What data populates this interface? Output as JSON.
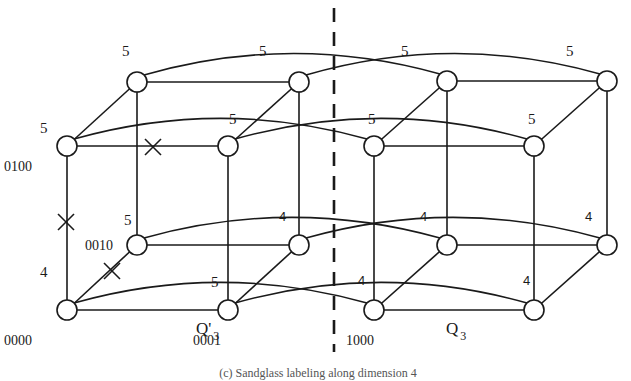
{
  "figure": {
    "caption": "(c) Sandglass labeling along dimension 4",
    "divider": {
      "x": 334,
      "y1": 8,
      "y2": 352
    },
    "cubes": [
      {
        "id": "left",
        "name": "Q'",
        "subscript": "3",
        "label_pos": [
          196,
          334
        ]
      },
      {
        "id": "right",
        "name": "Q",
        "subscript": "3",
        "label_pos": [
          446,
          334
        ]
      }
    ],
    "nodes": [
      {
        "id": "L_TBL",
        "x": 137,
        "y": 82
      },
      {
        "id": "L_TBR",
        "x": 299,
        "y": 82
      },
      {
        "id": "L_TFL",
        "x": 67,
        "y": 146,
        "addr": "0100"
      },
      {
        "id": "L_TFR",
        "x": 228,
        "y": 146
      },
      {
        "id": "L_BBL",
        "x": 137,
        "y": 245,
        "addr": "0010"
      },
      {
        "id": "L_BBR",
        "x": 299,
        "y": 245
      },
      {
        "id": "L_BFL",
        "x": 67,
        "y": 310,
        "addr": "0000"
      },
      {
        "id": "L_BFR",
        "x": 228,
        "y": 310,
        "addr": "0001"
      },
      {
        "id": "R_TBL",
        "x": 447,
        "y": 81
      },
      {
        "id": "R_TBR",
        "x": 607,
        "y": 81
      },
      {
        "id": "R_TFL",
        "x": 374,
        "y": 146
      },
      {
        "id": "R_TFR",
        "x": 534,
        "y": 146
      },
      {
        "id": "R_BBL",
        "x": 447,
        "y": 245
      },
      {
        "id": "R_BBR",
        "x": 607,
        "y": 245
      },
      {
        "id": "R_BFL",
        "x": 374,
        "y": 310,
        "addr": "1000"
      },
      {
        "id": "R_BFR",
        "x": 534,
        "y": 310
      }
    ],
    "address_labels": [
      {
        "text": "0100",
        "x": 4,
        "y": 171
      },
      {
        "text": "0010",
        "x": 85,
        "y": 250
      },
      {
        "text": "0000",
        "x": 4,
        "y": 345
      },
      {
        "text": "0001",
        "x": 193,
        "y": 345
      },
      {
        "text": "1000",
        "x": 346,
        "y": 345
      }
    ],
    "weight_labels": [
      {
        "text": "5",
        "x": 122,
        "y": 56
      },
      {
        "text": "5",
        "x": 259,
        "y": 56
      },
      {
        "text": "5",
        "x": 401,
        "y": 56
      },
      {
        "text": "5",
        "x": 566,
        "y": 56
      },
      {
        "text": "5",
        "x": 40,
        "y": 133
      },
      {
        "text": "5",
        "x": 229,
        "y": 124
      },
      {
        "text": "5",
        "x": 368,
        "y": 124
      },
      {
        "text": "5",
        "x": 528,
        "y": 124
      },
      {
        "text": "5",
        "x": 124,
        "y": 225
      },
      {
        "text": "4",
        "x": 279,
        "y": 221,
        "sans": true
      },
      {
        "text": "4",
        "x": 420,
        "y": 221,
        "sans": true
      },
      {
        "text": "4",
        "x": 585,
        "y": 221,
        "sans": true
      },
      {
        "text": "4",
        "x": 40,
        "y": 277
      },
      {
        "text": "5",
        "x": 211,
        "y": 287
      },
      {
        "text": "4",
        "x": 358,
        "y": 285,
        "sans": true
      },
      {
        "text": "4",
        "x": 523,
        "y": 285,
        "sans": true
      }
    ],
    "faulty_links": [
      {
        "between": [
          "L_TFL",
          "L_TFR"
        ],
        "x": 153,
        "y": 147
      },
      {
        "between": [
          "L_TFL",
          "L_BFL"
        ],
        "x": 66,
        "y": 222
      },
      {
        "between": [
          "L_BBL",
          "L_BFL"
        ],
        "x": 112,
        "y": 271
      }
    ]
  }
}
